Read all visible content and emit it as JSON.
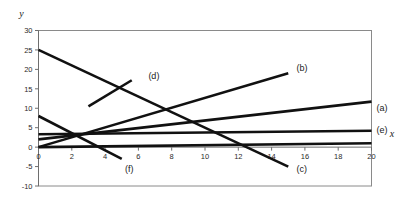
{
  "chart_data": {
    "type": "line",
    "title": "",
    "xlabel": "x",
    "ylabel": "y",
    "xlim": [
      0,
      20
    ],
    "ylim": [
      -10,
      30
    ],
    "grid": false,
    "legend_position": "inline-endpoint-labels",
    "x_ticks": [
      0,
      2,
      4,
      6,
      8,
      10,
      12,
      14,
      16,
      18,
      20
    ],
    "y_ticks": [
      -10,
      -5,
      0,
      5,
      10,
      15,
      20,
      25,
      30
    ],
    "x_tick_labels": [
      "0",
      "2",
      "4",
      "6",
      "8",
      "10",
      "12",
      "14",
      "16",
      "18",
      "20"
    ],
    "y_tick_labels": [
      "-10",
      "-5",
      "0",
      "5",
      "10",
      "15",
      "20",
      "25",
      "30"
    ],
    "series": [
      {
        "name": "(a)",
        "label": "(a)",
        "x": [
          0,
          20
        ],
        "values": [
          2,
          11.7
        ],
        "label_x": 20.3,
        "label_y": 9.2
      },
      {
        "name": "(b)",
        "label": "(b)",
        "x": [
          0,
          15
        ],
        "values": [
          0,
          19
        ],
        "label_x": 15.5,
        "label_y": 19.6
      },
      {
        "name": "(c)",
        "label": "(c)",
        "x": [
          0,
          15
        ],
        "values": [
          25,
          -5
        ],
        "label_x": 15.5,
        "label_y": -6.4
      },
      {
        "name": "(d)",
        "label": "(d)",
        "x": [
          3,
          5.6
        ],
        "values": [
          10.5,
          17.2
        ],
        "label_x": 6.6,
        "label_y": 17.6
      },
      {
        "name": "(e)",
        "label": "(e)",
        "x": [
          0,
          20
        ],
        "values": [
          3.3,
          4.2
        ],
        "label_x": 20.3,
        "label_y": 3.6
      },
      {
        "name": "(f)",
        "label": "(f)",
        "x": [
          0,
          5
        ],
        "values": [
          8,
          -3
        ],
        "label_x": 5.2,
        "label_y": -6.4
      },
      {
        "name": "baseline",
        "label": "",
        "x": [
          0,
          20
        ],
        "values": [
          0,
          1
        ],
        "label_x": null,
        "label_y": null
      }
    ]
  },
  "axis": {
    "x_name": "x",
    "y_name": "y",
    "x_name_pos": {
      "x": 21.1,
      "y": 2.6
    },
    "y_name_pos": {
      "x": -1.15,
      "y": 33.5
    }
  }
}
